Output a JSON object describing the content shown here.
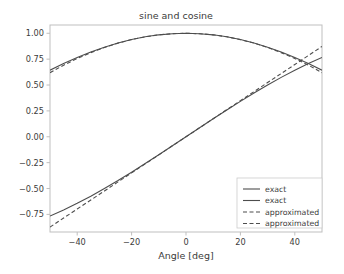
{
  "chart_data": {
    "type": "line",
    "title": "sine and cosine",
    "xlabel": "Angle [deg]",
    "ylabel": "",
    "xlim": [
      -50,
      50
    ],
    "ylim": [
      -0.92,
      1.08
    ],
    "grid": false,
    "legend_position": "lower right",
    "xticks": [
      -40,
      -20,
      0,
      20,
      40
    ],
    "xticklabels": [
      "−40",
      "−20",
      "0",
      "20",
      "40"
    ],
    "yticks": [
      1.0,
      0.75,
      0.5,
      0.25,
      0.0,
      -0.25,
      -0.5,
      -0.75
    ],
    "yticklabels": [
      "1.00",
      "0.75",
      "0.50",
      "0.25",
      "0.00",
      "−0.25",
      "−0.50",
      "−0.75"
    ],
    "x": [
      -50,
      -45,
      -40,
      -35,
      -30,
      -25,
      -20,
      -15,
      -10,
      -5,
      0,
      5,
      10,
      15,
      20,
      25,
      30,
      35,
      40,
      45,
      50
    ],
    "series": [
      {
        "name": "exact",
        "kind": "sine-exact",
        "style": "solid",
        "color": "#4d4d4d",
        "values": [
          -0.766,
          -0.707,
          -0.643,
          -0.574,
          -0.5,
          -0.423,
          -0.342,
          -0.259,
          -0.174,
          -0.087,
          0.0,
          0.087,
          0.174,
          0.259,
          0.342,
          0.423,
          0.5,
          0.574,
          0.643,
          0.707,
          0.766
        ]
      },
      {
        "name": "exact",
        "kind": "cosine-exact",
        "style": "solid",
        "color": "#4d4d4d",
        "values": [
          0.643,
          0.707,
          0.766,
          0.819,
          0.866,
          0.906,
          0.94,
          0.966,
          0.985,
          0.996,
          1.0,
          0.996,
          0.985,
          0.966,
          0.94,
          0.906,
          0.866,
          0.819,
          0.766,
          0.707,
          0.643
        ]
      },
      {
        "name": "approximated",
        "kind": "sine-approx",
        "style": "dashed",
        "color": "#4d4d4d",
        "values": [
          -0.873,
          -0.785,
          -0.698,
          -0.611,
          -0.524,
          -0.436,
          -0.349,
          -0.262,
          -0.175,
          -0.087,
          0.0,
          0.087,
          0.175,
          0.262,
          0.349,
          0.436,
          0.524,
          0.611,
          0.698,
          0.785,
          0.873
        ]
      },
      {
        "name": "approximated",
        "kind": "cosine-approx",
        "style": "dashed",
        "color": "#4d4d4d",
        "values": [
          0.619,
          0.692,
          0.756,
          0.813,
          0.863,
          0.905,
          0.939,
          0.966,
          0.985,
          0.996,
          1.0,
          0.996,
          0.985,
          0.966,
          0.939,
          0.905,
          0.863,
          0.813,
          0.756,
          0.692,
          0.619
        ]
      }
    ],
    "legend": [
      {
        "label": "exact",
        "style": "solid",
        "color": "#4d4d4d"
      },
      {
        "label": "exact",
        "style": "solid",
        "color": "#4d4d4d"
      },
      {
        "label": "approximated",
        "style": "dashed",
        "color": "#4d4d4d"
      },
      {
        "label": "approximated",
        "style": "dashed",
        "color": "#4d4d4d"
      }
    ],
    "colors": {
      "background": "#ffffff",
      "axes_frame": "#bfbfbf",
      "text": "#3b3b3b",
      "line": "#4d4d4d",
      "legend_frame": "#cccccc"
    }
  }
}
